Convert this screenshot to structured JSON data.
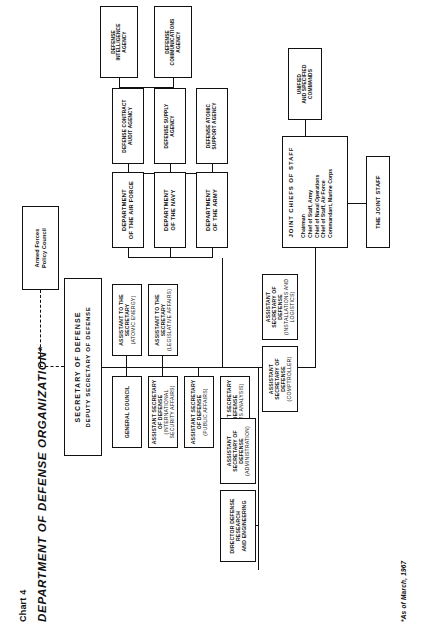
{
  "document": {
    "chart_number": "Chart 4",
    "title": "DEPARTMENT OF DEFENSE ORGANIZATION*",
    "footnote": "*As of March, 1967"
  },
  "chart_data": {
    "type": "diagram",
    "title": "DEPARTMENT OF DEFENSE ORGANIZATION*",
    "orientation": "rotated-90-landscape",
    "nodes": {
      "secretary_of_defense": {
        "line1": "SECRETARY OF DEFENSE",
        "line2": "DEPUTY SECRETARY OF DEFENSE"
      },
      "armed_forces_policy_council": {
        "line1": "Armed Forces",
        "line2": "Policy Council",
        "link_style": "dashed"
      },
      "general_council": {
        "line1": "GENERAL COUNCIL",
        "line2": ""
      },
      "asd_international_security_affairs": {
        "line1": "ASSISTANT SECRETARY OF DEFENSE",
        "line2": "(INTERNATIONAL SECURITY AFFAIRS)"
      },
      "asd_public_affairs": {
        "line1": "ASSISTANT SECRETARY OF DEFENSE",
        "line2": "(PUBLIC AFFAIRS)"
      },
      "asd_systems_analysis": {
        "line1": "ASSISTANT SECRETARY OF DEFENSE",
        "line2": "(SYSTEMS ANALYSIS)"
      },
      "director_defense_research": {
        "line1": "DIRECTOR DEFENSE RESEARCH",
        "line2": "AND ENGINEERING"
      },
      "asd_administration": {
        "line1": "ASSISTANT SECRETARY OF DEFENSE",
        "line2": "(ADMINISTRATION)"
      },
      "asd_comptroller": {
        "line1": "ASSISTANT SECRETARY OF DEFENSE",
        "line2": "(COMPTROLLER)"
      },
      "asd_installations_logistics": {
        "line1": "ASSISTANT SECRETARY OF DEFENSE",
        "line2": "(INSTALLATIONS AND LOGISTICS)"
      },
      "assistant_atomic_energy": {
        "line1": "ASSISTANT TO THE SECRETARY",
        "line2": "(ATOMIC ENERGY)"
      },
      "assistant_legislative_affairs": {
        "line1": "ASSISTANT TO THE SECRETARY",
        "line2": "(LEGISLATIVE AFFAIRS)"
      },
      "department_army": {
        "line1": "DEPARTMENT",
        "line2": "OF THE ARMY"
      },
      "department_navy": {
        "line1": "DEPARTMENT",
        "line2": "OF THE NAVY"
      },
      "department_air_force": {
        "line1": "DEPARTMENT",
        "line2": "OF THE AIR FORCE"
      },
      "joint_chiefs_of_staff": {
        "line1": "JOINT CHIEFS OF STAFF",
        "members": [
          "Chairman",
          "Chief of Staff, Army",
          "Chief of Naval Operations",
          "Chief of Staff, Air Force",
          "Commandant, Marine Corps"
        ]
      },
      "the_joint_staff": {
        "line1": "THE JOINT STAFF",
        "line2": ""
      },
      "unified_specified_commands": {
        "line1": "UNIFIED",
        "line2": "AND SPECIFIED",
        "line3": "COMMANDS"
      },
      "defense_atomic_support_agency": {
        "line1": "DEFENSE ATOMIC",
        "line2": "SUPPORT AGENCY"
      },
      "defense_supply_agency": {
        "line1": "DEFENSE SUPPLY",
        "line2": "AGENCY"
      },
      "defense_contract_audit_agency": {
        "line1": "DEFENSE CONTRACT",
        "line2": "AUDIT AGENCY"
      },
      "defense_communications_agency": {
        "line1": "DEFENSE",
        "line2": "COMMUNICATIONS",
        "line3": "AGENCY"
      },
      "defense_intelligence_agency": {
        "line1": "DEFENSE",
        "line2": "INTELLIGENCE",
        "line3": "AGENCY"
      }
    }
  }
}
